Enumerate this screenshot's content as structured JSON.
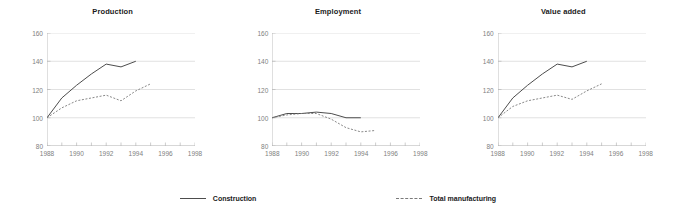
{
  "legend": {
    "position": "bottom-center",
    "entries": [
      {
        "label": "Construction",
        "style": "solid",
        "color": "#4d4d4d"
      },
      {
        "label": "Total manufacturing",
        "style": "dashed",
        "color": "#7a7a7a"
      }
    ]
  },
  "axis": {
    "ylim": [
      80,
      160
    ],
    "yticks": [
      80,
      100,
      120,
      140,
      160
    ],
    "xlim": [
      1988,
      1998
    ],
    "xticks": [
      1988,
      1990,
      1992,
      1994,
      1996,
      1998
    ],
    "grid": "horizontal"
  },
  "chart_data": [
    {
      "type": "line",
      "title": "Production",
      "xlabel": "",
      "ylabel": "",
      "xlim": [
        1988,
        1998
      ],
      "ylim": [
        80,
        160
      ],
      "xticks": [
        1988,
        1990,
        1992,
        1994,
        1996,
        1998
      ],
      "yticks": [
        80,
        100,
        120,
        140,
        160
      ],
      "grid": "horizontal",
      "legend": "bottom-center",
      "x": [
        1988,
        1989,
        1990,
        1991,
        1992,
        1993,
        1994,
        1995
      ],
      "series": [
        {
          "name": "Construction",
          "style": "solid",
          "color": "#4d4d4d",
          "values": [
            100,
            114,
            123,
            131,
            138,
            136,
            140,
            null
          ]
        },
        {
          "name": "Total manufacturing",
          "style": "dashed",
          "color": "#7a7a7a",
          "values": [
            100,
            107,
            112,
            114,
            116,
            112,
            119,
            124
          ]
        }
      ]
    },
    {
      "type": "line",
      "title": "Employment",
      "xlabel": "",
      "ylabel": "",
      "xlim": [
        1988,
        1998
      ],
      "ylim": [
        80,
        160
      ],
      "xticks": [
        1988,
        1990,
        1992,
        1994,
        1996,
        1998
      ],
      "yticks": [
        80,
        100,
        120,
        140,
        160
      ],
      "grid": "horizontal",
      "legend": "bottom-center",
      "x": [
        1988,
        1989,
        1990,
        1991,
        1992,
        1993,
        1994,
        1995
      ],
      "series": [
        {
          "name": "Construction",
          "style": "solid",
          "color": "#4d4d4d",
          "values": [
            100,
            103,
            103,
            104,
            103,
            100,
            100,
            null
          ]
        },
        {
          "name": "Total manufacturing",
          "style": "dashed",
          "color": "#7a7a7a",
          "values": [
            100,
            102,
            103,
            103,
            99,
            93,
            90,
            91
          ]
        }
      ]
    },
    {
      "type": "line",
      "title": "Value added",
      "xlabel": "",
      "ylabel": "",
      "xlim": [
        1988,
        1998
      ],
      "ylim": [
        80,
        160
      ],
      "xticks": [
        1988,
        1990,
        1992,
        1994,
        1996,
        1998
      ],
      "yticks": [
        80,
        100,
        120,
        140,
        160
      ],
      "grid": "horizontal",
      "legend": "bottom-center",
      "x": [
        1988,
        1989,
        1990,
        1991,
        1992,
        1993,
        1994,
        1995
      ],
      "series": [
        {
          "name": "Construction",
          "style": "solid",
          "color": "#4d4d4d",
          "values": [
            100,
            114,
            123,
            131,
            138,
            136,
            140,
            null
          ]
        },
        {
          "name": "Total manufacturing",
          "style": "dashed",
          "color": "#7a7a7a",
          "values": [
            100,
            108,
            112,
            114,
            116,
            113,
            119,
            124
          ]
        }
      ]
    }
  ]
}
